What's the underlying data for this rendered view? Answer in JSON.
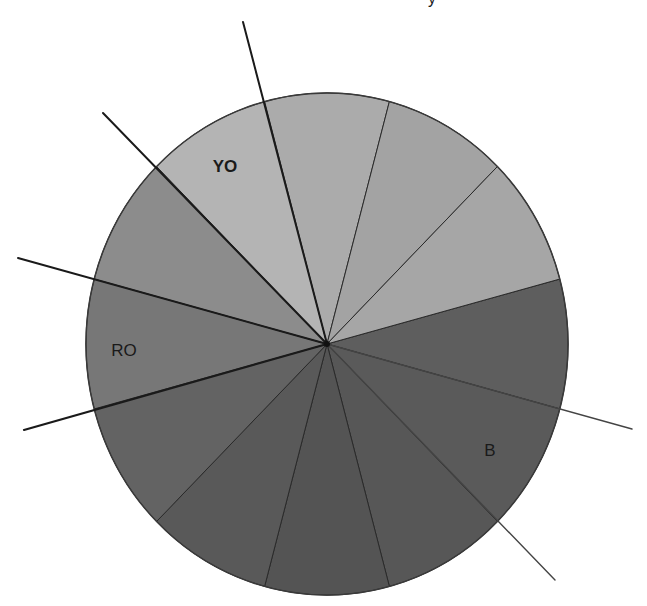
{
  "diagram": {
    "title_fragment": "y",
    "center": {
      "x": 327,
      "y": 344
    },
    "radius": {
      "rx": 241,
      "ry": 251
    },
    "sectors": [
      {
        "id": "s1",
        "start": -15,
        "end": 15,
        "fill": "#5e5e5e",
        "label": ""
      },
      {
        "id": "s2",
        "start": 15,
        "end": 45,
        "fill": "#5a5a5a",
        "label": "B"
      },
      {
        "id": "s3",
        "start": 45,
        "end": 75,
        "fill": "#575757",
        "label": ""
      },
      {
        "id": "s4",
        "start": 75,
        "end": 105,
        "fill": "#545454",
        "label": ""
      },
      {
        "id": "s5",
        "start": 105,
        "end": 135,
        "fill": "#595959",
        "label": ""
      },
      {
        "id": "s6",
        "start": 135,
        "end": 165,
        "fill": "#636363",
        "label": ""
      },
      {
        "id": "s7",
        "start": 165,
        "end": 195,
        "fill": "#777777",
        "label": "RO"
      },
      {
        "id": "s8",
        "start": 195,
        "end": 225,
        "fill": "#8c8c8c",
        "label": ""
      },
      {
        "id": "s9",
        "start": 225,
        "end": 255,
        "fill": "#b4b4b4",
        "label": "YO"
      },
      {
        "id": "s10",
        "start": 255,
        "end": 285,
        "fill": "#ababab",
        "label": ""
      },
      {
        "id": "s11",
        "start": 285,
        "end": 315,
        "fill": "#a3a3a3",
        "label": ""
      },
      {
        "id": "s12",
        "start": 315,
        "end": 345,
        "fill": "#a6a6a6",
        "label": ""
      }
    ],
    "labels": [
      {
        "text": "YO",
        "x": 225,
        "y": 172,
        "bold": true
      },
      {
        "text": "RO",
        "x": 124,
        "y": 356,
        "bold": false
      },
      {
        "text": "B",
        "x": 490,
        "y": 456,
        "bold": false
      }
    ],
    "extended_lines": [
      {
        "x1": 327,
        "y1": 344,
        "x2": 243,
        "y2": 22,
        "color": "#1a1a1a",
        "width": 2
      },
      {
        "x1": 327,
        "y1": 344,
        "x2": 103,
        "y2": 113,
        "color": "#1a1a1a",
        "width": 2
      },
      {
        "x1": 327,
        "y1": 344,
        "x2": 18,
        "y2": 258,
        "color": "#1a1a1a",
        "width": 2
      },
      {
        "x1": 327,
        "y1": 344,
        "x2": 24,
        "y2": 430,
        "color": "#1a1a1a",
        "width": 2.2
      },
      {
        "x1": 327,
        "y1": 344,
        "x2": 632,
        "y2": 429,
        "color": "#444444",
        "width": 1.4
      },
      {
        "x1": 327,
        "y1": 344,
        "x2": 555,
        "y2": 580,
        "color": "#444444",
        "width": 1.4
      }
    ],
    "colors": {
      "outline": "#3a3a3a",
      "divider": "#2a2a2a",
      "background": "#ffffff"
    }
  }
}
